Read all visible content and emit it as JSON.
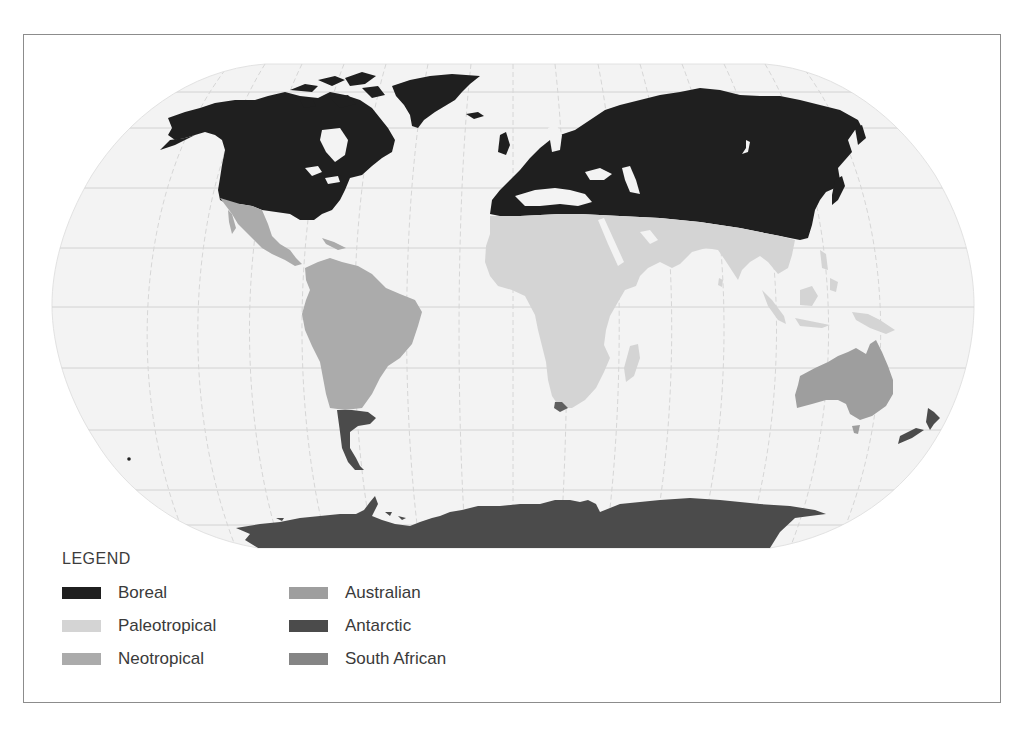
{
  "map": {
    "projection": "Robinson",
    "ocean_color": "#f3f3f3",
    "graticule_color": "#cfcfcf",
    "regions": [
      {
        "id": "boreal",
        "name": "Boreal",
        "color": "#1f1f1f",
        "areas": [
          "North America (north of Mexico)",
          "Greenland",
          "Iceland",
          "Europe",
          "North Africa coast",
          "Northern & Central Asia",
          "Japan"
        ]
      },
      {
        "id": "paleotropical",
        "name": "Paleotropical",
        "color": "#d4d4d4",
        "areas": [
          "Africa",
          "Madagascar",
          "Arabia",
          "India",
          "Southeast Asia",
          "Indonesia",
          "New Guinea"
        ]
      },
      {
        "id": "neotropical",
        "name": "Neotropical",
        "color": "#ababab",
        "areas": [
          "Mexico",
          "Central America",
          "Caribbean",
          "Northern South America"
        ]
      },
      {
        "id": "australian",
        "name": "Australian",
        "color": "#9e9e9e",
        "areas": [
          "Australia",
          "Tasmania"
        ]
      },
      {
        "id": "antarctic",
        "name": "Antarctic",
        "color": "#4b4b4b",
        "areas": [
          "Antarctica",
          "Southern South America",
          "New Zealand"
        ]
      },
      {
        "id": "south_african",
        "name": "South African",
        "color": "#858585",
        "areas": [
          "Cape region of South Africa"
        ]
      }
    ]
  },
  "legend": {
    "title": "LEGEND",
    "items": [
      {
        "label": "Boreal",
        "color": "#1f1f1f"
      },
      {
        "label": "Paleotropical",
        "color": "#d4d4d4"
      },
      {
        "label": "Neotropical",
        "color": "#ababab"
      },
      {
        "label": "Australian",
        "color": "#9e9e9e"
      },
      {
        "label": "Antarctic",
        "color": "#4b4b4b"
      },
      {
        "label": "South African",
        "color": "#858585"
      }
    ]
  }
}
